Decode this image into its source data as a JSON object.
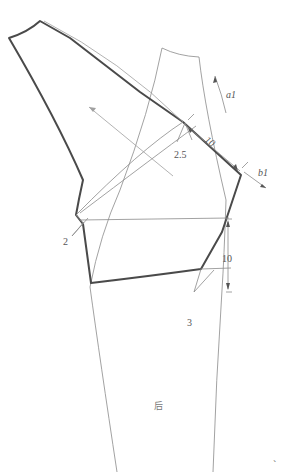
{
  "diagram": {
    "type": "garment-pattern-draft",
    "labels": {
      "dim_2_5": "2.5",
      "dim_10_top": "10",
      "dim_10_side": "10",
      "dim_2": "2",
      "dim_3": "3",
      "arrow_a1": "a1",
      "arrow_b1": "b1",
      "panel_back": "后",
      "corner_mark": "`"
    },
    "colors": {
      "outline": "#4a4a4a",
      "construction": "#8a8a8a",
      "text": "#555555"
    }
  }
}
